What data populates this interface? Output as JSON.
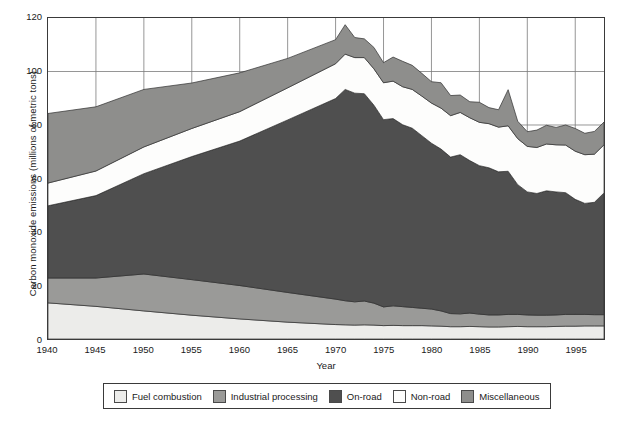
{
  "chart_data": {
    "type": "area",
    "stacked": true,
    "title": "",
    "xlabel": "Year",
    "ylabel": "Carbon monoxide emissions (millions of metric tons)",
    "xlim": [
      1940,
      1998
    ],
    "ylim": [
      0,
      120
    ],
    "yticks": [
      0,
      20,
      40,
      60,
      80,
      100,
      120
    ],
    "xticks": [
      1940,
      1945,
      1950,
      1955,
      1960,
      1965,
      1970,
      1975,
      1980,
      1985,
      1990,
      1995
    ],
    "grid": "both",
    "legend_position": "bottom",
    "colors": {
      "fuel_combustion": "#ececea",
      "industrial_processing": "#9a9a98",
      "on_road": "#4f4f4f",
      "non_road": "#fdfdfc",
      "miscellaneous": "#8e8e8c",
      "axis": "#3a3a3a",
      "gridline": "#7a7a7a",
      "outline": "#2e2e2e"
    },
    "x": [
      1940,
      1945,
      1950,
      1955,
      1960,
      1965,
      1970,
      1971,
      1972,
      1973,
      1974,
      1975,
      1976,
      1977,
      1978,
      1979,
      1980,
      1981,
      1982,
      1983,
      1984,
      1985,
      1986,
      1987,
      1988,
      1989,
      1990,
      1991,
      1992,
      1993,
      1994,
      1995,
      1996,
      1997,
      1998
    ],
    "series": [
      {
        "name": "Fuel combustion",
        "color": "#ececea",
        "values": [
          13.5,
          12.2,
          10.5,
          8.9,
          7.5,
          6.3,
          5.4,
          5.3,
          5.2,
          5.3,
          5.2,
          5.0,
          5.1,
          5.0,
          5.0,
          5.0,
          4.9,
          4.8,
          4.6,
          4.6,
          4.7,
          4.6,
          4.5,
          4.5,
          4.6,
          4.7,
          4.6,
          4.6,
          4.6,
          4.7,
          4.8,
          4.8,
          4.9,
          4.9,
          4.9
        ]
      },
      {
        "name": "Industrial processing",
        "color": "#9a9a98",
        "values": [
          9.3,
          10.6,
          13.8,
          13.3,
          12.5,
          11.1,
          9.5,
          9.0,
          8.7,
          8.9,
          8.2,
          7.0,
          7.3,
          7.1,
          6.8,
          6.5,
          6.3,
          5.7,
          4.9,
          4.8,
          5.0,
          4.7,
          4.5,
          4.5,
          4.6,
          4.5,
          4.4,
          4.3,
          4.3,
          4.3,
          4.4,
          4.4,
          4.3,
          4.2,
          4.2
        ]
      },
      {
        "name": "On-road",
        "color": "#4f4f4f",
        "values": [
          27.0,
          30.8,
          37.5,
          46.0,
          54.0,
          64.5,
          75.0,
          79.0,
          78.0,
          77.5,
          74.0,
          70.0,
          70.0,
          68.0,
          67.0,
          64.5,
          62.0,
          60.5,
          58.5,
          59.5,
          57.0,
          55.5,
          55.0,
          53.5,
          53.5,
          48.5,
          46.0,
          45.5,
          46.5,
          46.0,
          45.5,
          43.0,
          41.5,
          42.0,
          45.5
        ]
      },
      {
        "name": "Non-road",
        "color": "#fdfdfc",
        "values": [
          8.5,
          9.2,
          10.0,
          10.5,
          11.0,
          12.0,
          13.0,
          13.2,
          13.3,
          13.5,
          13.6,
          13.8,
          14.0,
          14.2,
          14.5,
          14.8,
          15.0,
          15.3,
          15.5,
          15.8,
          16.0,
          16.2,
          16.5,
          16.7,
          17.0,
          17.2,
          17.0,
          17.2,
          17.5,
          17.6,
          17.8,
          18.0,
          18.2,
          18.0,
          18.0
        ]
      },
      {
        "name": "Miscellaneous",
        "color": "#8e8e8c",
        "values": [
          26.0,
          24.0,
          21.5,
          17.0,
          14.5,
          11.0,
          9.0,
          11.0,
          7.5,
          7.0,
          8.0,
          7.5,
          9.0,
          9.5,
          9.0,
          8.5,
          8.0,
          9.5,
          7.5,
          6.5,
          6.0,
          7.5,
          6.0,
          6.5,
          13.5,
          6.5,
          5.5,
          6.5,
          7.0,
          6.5,
          7.5,
          8.5,
          8.0,
          8.5,
          8.5
        ]
      }
    ]
  },
  "legend": {
    "items": [
      {
        "label": "Fuel combustion",
        "color": "#ececea"
      },
      {
        "label": "Industrial processing",
        "color": "#9a9a98"
      },
      {
        "label": "On-road",
        "color": "#4f4f4f"
      },
      {
        "label": "Non-road",
        "color": "#fdfdfc"
      },
      {
        "label": "Miscellaneous",
        "color": "#8e8e8c"
      }
    ]
  }
}
